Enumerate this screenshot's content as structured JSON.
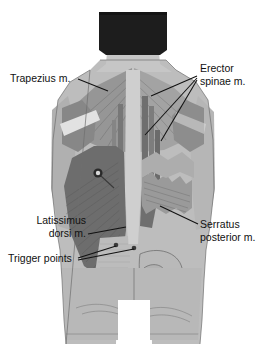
{
  "figure": {
    "background_color": "#ffffff",
    "view": "posterior",
    "dimensions": {
      "width": 265,
      "height": 364
    }
  },
  "palette": {
    "hair": "#1d1d1d",
    "skin_light": "#c9c9c9",
    "skin_mid": "#b4b4b4",
    "muscle_light": "#c2c2c2",
    "muscle_mid": "#9e9e9e",
    "muscle_dark": "#7d7d7d",
    "muscle_darker": "#636363",
    "tendon": "#dedede",
    "spine": "#cfcfcf",
    "outline": "#6f6f6f",
    "leader": "#111111",
    "text": "#111111",
    "trigger_point": "#2a2a2a"
  },
  "labels": [
    {
      "id": "trapezius",
      "name": "Trapezius m.",
      "lines": [
        "Trapezius m."
      ],
      "x": 10,
      "y": 82,
      "anchor": "start",
      "leaders": [
        {
          "path": "M 78 79 L 108 91"
        }
      ]
    },
    {
      "id": "erector-spinae",
      "name": "Erector spinae m.",
      "lines": [
        "Erector",
        "spinae m."
      ],
      "x": 200,
      "y": 72,
      "anchor": "start",
      "leaders": [
        {
          "path": "M 197 76 L 151 96"
        },
        {
          "path": "M 197 78 L 145 135"
        },
        {
          "path": "M 197 80 L 161 141"
        }
      ]
    },
    {
      "id": "latissimus-dorsi",
      "name": "Latissimus dorsi m.",
      "lines": [
        "Latissimus",
        "dorsi m."
      ],
      "x": 86,
      "y": 224,
      "anchor": "end",
      "leaders": [
        {
          "path": "M 88 234 L 126 227"
        }
      ]
    },
    {
      "id": "trigger-points",
      "name": "Trigger points",
      "lines": [
        "Trigger points"
      ],
      "x": 8,
      "y": 262,
      "anchor": "start",
      "leaders": [
        {
          "path": "M 78 258 L 116 246"
        },
        {
          "path": "M 78 260 L 134 249"
        }
      ]
    },
    {
      "id": "serratus-posterior",
      "name": "Serratus posterior m.",
      "lines": [
        "Serratus",
        "posterior m."
      ],
      "x": 200,
      "y": 228,
      "anchor": "start",
      "leaders": [
        {
          "path": "M 198 224 L 160 206"
        }
      ]
    }
  ],
  "trigger_points": [
    {
      "id": "tp-upper-lat",
      "cx": 98,
      "cy": 173,
      "r": 4.2,
      "style": "ringed"
    },
    {
      "id": "tp-lower-left",
      "cx": 116,
      "cy": 245,
      "r": 2.1,
      "style": "dot"
    },
    {
      "id": "tp-lower-right",
      "cx": 134,
      "cy": 248,
      "r": 2.1,
      "style": "dot"
    }
  ],
  "anatomy_regions": [
    {
      "id": "hair",
      "name": "hair"
    },
    {
      "id": "neck",
      "name": "neck"
    },
    {
      "id": "trapezius",
      "name": "trapezius muscle"
    },
    {
      "id": "deltoid",
      "name": "deltoid muscle"
    },
    {
      "id": "erector-spinae",
      "name": "erector spinae muscle"
    },
    {
      "id": "latissimus-dorsi",
      "name": "latissimus dorsi muscle"
    },
    {
      "id": "serratus-posterior",
      "name": "serratus posterior muscle"
    },
    {
      "id": "pelvis",
      "name": "pelvis"
    },
    {
      "id": "gluteal",
      "name": "gluteal region"
    },
    {
      "id": "thigh-left",
      "name": "left thigh"
    },
    {
      "id": "thigh-right",
      "name": "right thigh"
    }
  ]
}
